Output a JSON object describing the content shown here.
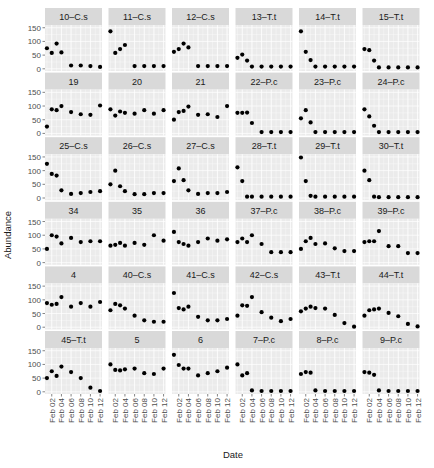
{
  "chart_data": {
    "type": "scatter",
    "title": "",
    "xlabel": "Date",
    "ylabel": "Abundance",
    "ylim": [
      0,
      160
    ],
    "y_ticks": [
      0,
      50,
      100,
      150
    ],
    "x_ticks": [
      "Feb 02",
      "Feb 04",
      "Feb 06",
      "Feb 08",
      "Feb 10",
      "Feb 12"
    ],
    "x_days": [
      1,
      2,
      3,
      4,
      6,
      8,
      10,
      12
    ],
    "x_range": [
      0.6,
      12.4
    ],
    "grid": true,
    "legend": "none",
    "facets": [
      {
        "label": "10–C.s",
        "values": [
          75,
          58,
          92,
          60,
          12,
          12,
          10,
          7
        ]
      },
      {
        "label": "11–C.s",
        "values": [
          137,
          58,
          72,
          87,
          10,
          10,
          10,
          10
        ]
      },
      {
        "label": "12–C.s",
        "values": [
          62,
          72,
          92,
          78,
          10,
          10,
          10,
          10
        ]
      },
      {
        "label": "13–T.t",
        "values": [
          40,
          52,
          30,
          8,
          8,
          8,
          8,
          8
        ]
      },
      {
        "label": "14–T.t",
        "values": [
          137,
          62,
          32,
          8,
          8,
          8,
          8,
          8
        ]
      },
      {
        "label": "15–T.t",
        "values": [
          72,
          68,
          30,
          5,
          5,
          5,
          5,
          5
        ]
      },
      {
        "label": "19",
        "values": [
          25,
          88,
          85,
          100,
          78,
          70,
          68,
          102
        ]
      },
      {
        "label": "20",
        "values": [
          88,
          65,
          80,
          75,
          72,
          85,
          72,
          85
        ]
      },
      {
        "label": "21",
        "values": [
          50,
          78,
          82,
          98,
          68,
          70,
          60,
          100
        ]
      },
      {
        "label": "22–P.c",
        "values": [
          75,
          75,
          76,
          38,
          5,
          5,
          5,
          5
        ]
      },
      {
        "label": "23–P.c",
        "values": [
          55,
          85,
          40,
          5,
          5,
          5,
          5,
          5
        ]
      },
      {
        "label": "24–P.c",
        "values": [
          88,
          62,
          28,
          5,
          5,
          5,
          5,
          5
        ]
      },
      {
        "label": "25–C.s",
        "values": [
          125,
          88,
          82,
          28,
          15,
          18,
          22,
          25
        ]
      },
      {
        "label": "26–C.s",
        "values": [
          50,
          100,
          43,
          25,
          14,
          14,
          18,
          18
        ]
      },
      {
        "label": "27–C.s",
        "values": [
          62,
          108,
          65,
          28,
          15,
          18,
          18,
          22
        ]
      },
      {
        "label": "28–T.t",
        "values": [
          112,
          62,
          5,
          5,
          5,
          5,
          5,
          5
        ]
      },
      {
        "label": "29–T.t",
        "values": [
          148,
          62,
          8,
          5,
          5,
          5,
          5,
          5
        ]
      },
      {
        "label": "30–T.t",
        "values": [
          100,
          65,
          5,
          3,
          3,
          3,
          3,
          3
        ]
      },
      {
        "label": "34",
        "values": [
          50,
          100,
          95,
          70,
          90,
          75,
          78,
          78
        ]
      },
      {
        "label": "35",
        "values": [
          62,
          65,
          72,
          62,
          72,
          65,
          100,
          80
        ]
      },
      {
        "label": "36",
        "values": [
          112,
          75,
          68,
          62,
          75,
          88,
          80,
          85
        ]
      },
      {
        "label": "37–P.c",
        "values": [
          75,
          88,
          75,
          100,
          68,
          38,
          38,
          38
        ]
      },
      {
        "label": "38–P.c",
        "values": [
          50,
          78,
          90,
          68,
          70,
          52,
          42,
          42
        ]
      },
      {
        "label": "39–P.c",
        "values": [
          75,
          78,
          78,
          115,
          60,
          60,
          35,
          35
        ]
      },
      {
        "label": "4",
        "values": [
          88,
          82,
          85,
          110,
          75,
          88,
          75,
          92
        ]
      },
      {
        "label": "40–C.s",
        "values": [
          62,
          85,
          80,
          68,
          42,
          25,
          20,
          20
        ]
      },
      {
        "label": "41–C.s",
        "values": [
          125,
          70,
          65,
          75,
          38,
          25,
          25,
          30
        ]
      },
      {
        "label": "42–C.s",
        "values": [
          42,
          80,
          78,
          110,
          55,
          35,
          22,
          30
        ]
      },
      {
        "label": "43–T.t",
        "values": [
          58,
          68,
          75,
          70,
          68,
          45,
          15,
          2
        ]
      },
      {
        "label": "44–T.t",
        "values": [
          42,
          62,
          65,
          68,
          52,
          40,
          12,
          3
        ]
      },
      {
        "label": "45–T.t",
        "values": [
          50,
          75,
          58,
          92,
          72,
          50,
          15,
          3
        ]
      },
      {
        "label": "5",
        "values": [
          100,
          80,
          78,
          82,
          85,
          68,
          65,
          85
        ]
      },
      {
        "label": "6",
        "values": [
          135,
          98,
          85,
          85,
          60,
          68,
          75,
          88
        ]
      },
      {
        "label": "7–P.c",
        "values": [
          100,
          60,
          68,
          5,
          3,
          3,
          3,
          3
        ]
      },
      {
        "label": "8–P.c",
        "values": [
          65,
          72,
          70,
          5,
          3,
          3,
          3,
          3
        ]
      },
      {
        "label": "9–P.c",
        "values": [
          72,
          70,
          62,
          5,
          3,
          3,
          3,
          3
        ]
      }
    ],
    "layout": {
      "ncol": 6,
      "nrow": 6
    }
  },
  "colors": {
    "panel_bg": "#ebebeb",
    "strip_bg": "#d9d9d9",
    "grid_major": "#ffffff",
    "point": "#000000",
    "tick_text": "#4d4d4d"
  }
}
